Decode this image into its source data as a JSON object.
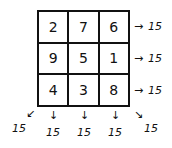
{
  "grid": {
    "rows": [
      [
        "2",
        "7",
        "6"
      ],
      [
        "9",
        "5",
        "1"
      ],
      [
        "4",
        "3",
        "8"
      ]
    ]
  },
  "row_sums": [
    "15",
    "15",
    "15"
  ],
  "column_sums": [
    "15",
    "15",
    "15"
  ],
  "diagonal_sums": {
    "anti_diagonal": "15",
    "main_diagonal": "15"
  },
  "arrows": {
    "right": "→",
    "down": "↓",
    "down_left": "↙",
    "down_right": "↘"
  }
}
